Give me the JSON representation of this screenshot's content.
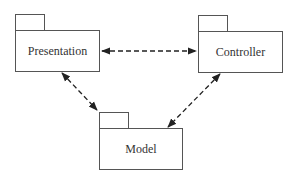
{
  "diagram": {
    "packages": [
      {
        "id": "presentation",
        "label": "Presentation"
      },
      {
        "id": "controller",
        "label": "Controller"
      },
      {
        "id": "model",
        "label": "Model"
      }
    ],
    "dependencies": [
      {
        "from": "presentation",
        "to": "controller",
        "style": "dashed",
        "arrows": "both"
      },
      {
        "from": "presentation",
        "to": "model",
        "style": "dashed",
        "arrows": "both"
      },
      {
        "from": "controller",
        "to": "model",
        "style": "dashed",
        "arrows": "both"
      }
    ],
    "colors": {
      "line": "#222222",
      "box_border": "#555555",
      "background": "#ffffff"
    }
  }
}
